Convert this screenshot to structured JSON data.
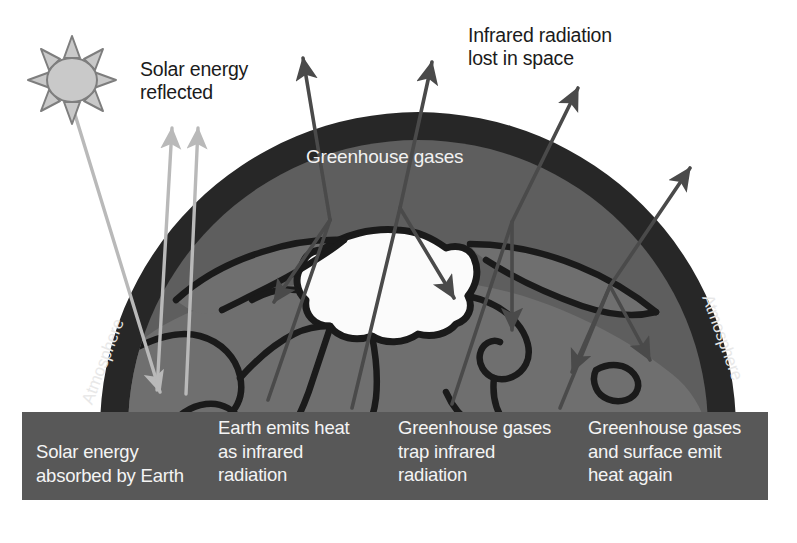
{
  "figure": {
    "kind": "greenhouse-effect-diagram",
    "background_color": "#ffffff"
  },
  "colors": {
    "atmosphere": "#272727",
    "land": "#6f6f6f",
    "ocean": "#5a5a5a",
    "ice_cap": "#fbfbfb",
    "coastline": "#1a1a1a",
    "caption_box": "#585858",
    "solar_arrow": "#b9b9b9",
    "infrared_arrow": "#4a4a4a",
    "sun_fill": "#c9c9c9",
    "sun_stroke": "#8a8a8a",
    "text_dark": "#1b1b1b",
    "text_light": "#f2f2f2"
  },
  "labels": {
    "solar_energy_reflected": "Solar energy\nreflected",
    "infrared_lost_in_space": "Infrared radiation\nlost in space",
    "greenhouse_gases": "Greenhouse gases",
    "atmosphere_left": "Atmosphere",
    "atmosphere_right": "Atmosphere"
  },
  "caption": {
    "blocks": [
      "Solar energy\nabsorbed by Earth",
      "Earth emits heat\nas infrared\nradiation",
      "Greenhouse gases\ntrap infrared\nradiation",
      "Greenhouse gases\nand surface emit\nheat again"
    ]
  },
  "icons": {
    "sun": "sun-icon",
    "solar_arrow": "solar-ray-arrow-icon",
    "infrared_arrow": "infrared-ray-arrow-icon"
  }
}
